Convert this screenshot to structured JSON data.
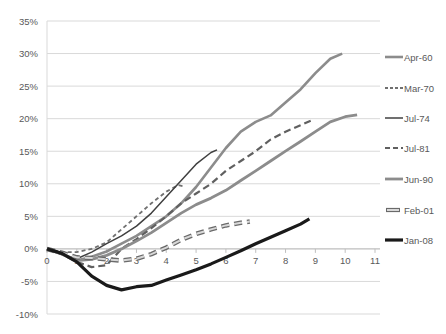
{
  "chart_data": {
    "type": "line",
    "title": "",
    "xlabel": "",
    "ylabel": "",
    "xlim": [
      0,
      11
    ],
    "ylim": [
      -10,
      35
    ],
    "x_ticks": [
      "0",
      "1",
      "2",
      "3",
      "4",
      "5",
      "6",
      "7",
      "8",
      "9",
      "10",
      "11"
    ],
    "y_ticks": [
      "-10%",
      "-5%",
      "0%",
      "5%",
      "10%",
      "15%",
      "20%",
      "25%",
      "30%",
      "35%"
    ],
    "grid": "horizontal",
    "legend_position": "right",
    "series": [
      {
        "name": "Apr-60",
        "style": "solid-thick-gray",
        "color": "#8c8c8c",
        "width": 2.6,
        "dash": "",
        "points": [
          [
            0,
            0
          ],
          [
            0.5,
            -0.8
          ],
          [
            1,
            -1.8
          ],
          [
            1.5,
            -1.2
          ],
          [
            2,
            -0.4
          ],
          [
            2.5,
            0.8
          ],
          [
            3,
            2.0
          ],
          [
            3.5,
            3.5
          ],
          [
            4,
            5.0
          ],
          [
            4.5,
            7.0
          ],
          [
            5,
            9.5
          ],
          [
            5.5,
            12.5
          ],
          [
            6,
            15.5
          ],
          [
            6.5,
            18.0
          ],
          [
            7,
            19.5
          ],
          [
            7.5,
            20.5
          ],
          [
            8,
            22.5
          ],
          [
            8.5,
            24.5
          ],
          [
            9,
            27.0
          ],
          [
            9.5,
            29.2
          ],
          [
            9.9,
            30.0
          ]
        ]
      },
      {
        "name": "Mar-70",
        "style": "dashed-gray",
        "color": "#707070",
        "width": 1.8,
        "dash": "4,3",
        "points": [
          [
            0,
            0
          ],
          [
            0.5,
            -0.5
          ],
          [
            1,
            -0.5
          ],
          [
            1.5,
            0.0
          ],
          [
            2,
            1.0
          ],
          [
            2.5,
            3.0
          ],
          [
            3,
            5.0
          ],
          [
            3.5,
            7.0
          ],
          [
            4,
            8.8
          ],
          [
            4.4,
            9.8
          ],
          [
            4.6,
            9.6
          ]
        ]
      },
      {
        "name": "Jul-74",
        "style": "solid-thin-dark",
        "color": "#404040",
        "width": 1.5,
        "dash": "",
        "points": [
          [
            0,
            0
          ],
          [
            0.5,
            -0.8
          ],
          [
            1,
            -1.5
          ],
          [
            1.5,
            -0.5
          ],
          [
            2,
            0.8
          ],
          [
            2.5,
            2.0
          ],
          [
            3,
            3.5
          ],
          [
            3.5,
            5.5
          ],
          [
            4,
            8.0
          ],
          [
            4.5,
            10.5
          ],
          [
            5,
            13.0
          ],
          [
            5.5,
            14.8
          ],
          [
            5.7,
            15.2
          ]
        ]
      },
      {
        "name": "Jul-81",
        "style": "dashed-thick-gray",
        "color": "#606060",
        "width": 2.2,
        "dash": "7,4",
        "points": [
          [
            0,
            0
          ],
          [
            0.5,
            -0.8
          ],
          [
            1,
            -2.0
          ],
          [
            1.5,
            -2.8
          ],
          [
            2,
            -2.5
          ],
          [
            2.5,
            0.0
          ],
          [
            3,
            1.5
          ],
          [
            3.5,
            3.2
          ],
          [
            4,
            5.0
          ],
          [
            4.5,
            7.0
          ],
          [
            5,
            8.5
          ],
          [
            5.5,
            10.0
          ],
          [
            6,
            12.0
          ],
          [
            6.5,
            13.5
          ],
          [
            7,
            15.0
          ],
          [
            7.5,
            16.8
          ],
          [
            8,
            18.0
          ],
          [
            8.5,
            19.0
          ],
          [
            8.9,
            19.8
          ]
        ]
      },
      {
        "name": "Jun-90",
        "style": "solid-thick-gray",
        "color": "#8c8c8c",
        "width": 2.8,
        "dash": "",
        "points": [
          [
            0,
            0
          ],
          [
            0.5,
            -0.8
          ],
          [
            1,
            -1.8
          ],
          [
            1.5,
            -1.6
          ],
          [
            2,
            -1.0
          ],
          [
            2.5,
            0.0
          ],
          [
            3,
            1.2
          ],
          [
            3.5,
            2.5
          ],
          [
            4,
            4.0
          ],
          [
            4.5,
            5.5
          ],
          [
            5,
            6.8
          ],
          [
            5.5,
            7.8
          ],
          [
            6,
            9.0
          ],
          [
            6.5,
            10.5
          ],
          [
            7,
            12.0
          ],
          [
            7.5,
            13.5
          ],
          [
            8,
            15.0
          ],
          [
            8.5,
            16.5
          ],
          [
            9,
            18.0
          ],
          [
            9.5,
            19.5
          ],
          [
            10,
            20.3
          ],
          [
            10.4,
            20.6
          ]
        ]
      },
      {
        "name": "Feb-01",
        "style": "hollow-dashed",
        "color": "#a0a0a0",
        "width": 3.2,
        "dash": "8,5",
        "points": [
          [
            0,
            0
          ],
          [
            0.5,
            -0.6
          ],
          [
            1,
            -1.3
          ],
          [
            1.5,
            -1.4
          ],
          [
            2,
            -1.6
          ],
          [
            2.5,
            -1.8
          ],
          [
            3,
            -1.5
          ],
          [
            3.5,
            -0.8
          ],
          [
            4,
            0.2
          ],
          [
            4.5,
            1.4
          ],
          [
            5,
            2.3
          ],
          [
            5.5,
            3.0
          ],
          [
            6,
            3.6
          ],
          [
            6.5,
            4.0
          ],
          [
            6.8,
            4.2
          ]
        ]
      },
      {
        "name": "Jan-08",
        "style": "solid-extra-thick-black",
        "color": "#1a1a1a",
        "width": 3.2,
        "dash": "",
        "points": [
          [
            0,
            0
          ],
          [
            0.5,
            -0.7
          ],
          [
            1,
            -2.0
          ],
          [
            1.5,
            -4.2
          ],
          [
            2,
            -5.6
          ],
          [
            2.5,
            -6.3
          ],
          [
            3,
            -5.8
          ],
          [
            3.5,
            -5.6
          ],
          [
            4,
            -4.8
          ],
          [
            4.5,
            -4.0
          ],
          [
            5,
            -3.2
          ],
          [
            5.5,
            -2.3
          ],
          [
            6,
            -1.3
          ],
          [
            6.5,
            -0.3
          ],
          [
            7,
            0.8
          ],
          [
            7.5,
            1.8
          ],
          [
            8,
            2.8
          ],
          [
            8.5,
            3.8
          ],
          [
            8.8,
            4.6
          ]
        ]
      }
    ]
  }
}
